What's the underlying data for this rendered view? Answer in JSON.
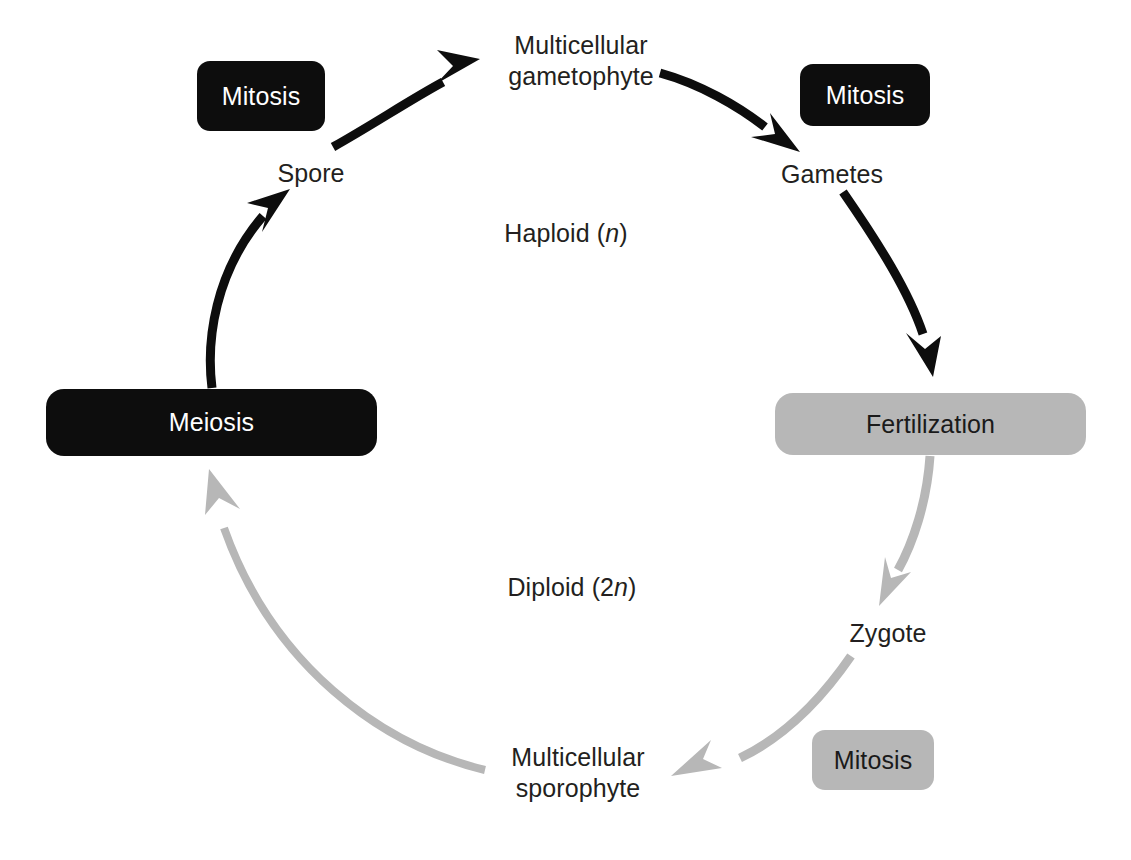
{
  "diagram": {
    "colors": {
      "haploid_phase": "#0d0d0d",
      "diploid_phase": "#b7b7b7",
      "background": "#ffffff",
      "text": "#231f20",
      "dark_box_text": "#ffffff",
      "light_box_text": "#1a1a1a"
    },
    "phase_labels": [
      {
        "id": "haploid",
        "prefix": "Haploid (",
        "variable": "n",
        "suffix": ")",
        "x": 566,
        "y": 232
      },
      {
        "id": "diploid",
        "prefix": "Diploid (2",
        "variable": "n",
        "suffix": ")",
        "x": 572,
        "y": 586
      }
    ],
    "nodes": [
      {
        "id": "spore",
        "label": "Spore",
        "x": 311,
        "y": 171,
        "lines": 1
      },
      {
        "id": "multicellular-gametophyte",
        "label": "Multicellular\ngametophyte",
        "x": 581,
        "y": 58,
        "lines": 2
      },
      {
        "id": "gametes",
        "label": "Gametes",
        "x": 832,
        "y": 172,
        "lines": 1
      },
      {
        "id": "zygote",
        "label": "Zygote",
        "x": 888,
        "y": 631,
        "lines": 1
      },
      {
        "id": "multicellular-sporophyte",
        "label": "Multicellular\nsporophyte",
        "x": 578,
        "y": 770,
        "lines": 2
      }
    ],
    "process_boxes": [
      {
        "id": "mitosis-spore",
        "label": "Mitosis",
        "phase": "dark",
        "x": 197,
        "y": 61,
        "w": 128,
        "h": 70,
        "wide": false
      },
      {
        "id": "mitosis-gametes",
        "label": "Mitosis",
        "phase": "dark",
        "x": 800,
        "y": 64,
        "w": 130,
        "h": 62,
        "wide": false
      },
      {
        "id": "meiosis",
        "label": "Meiosis",
        "phase": "dark",
        "x": 46,
        "y": 389,
        "w": 331,
        "h": 67,
        "wide": true
      },
      {
        "id": "fertilization",
        "label": "Fertilization",
        "phase": "light",
        "x": 775,
        "y": 393,
        "w": 311,
        "h": 62,
        "wide": true
      },
      {
        "id": "mitosis-sporophyte",
        "label": "Mitosis",
        "phase": "light",
        "x": 812,
        "y": 730,
        "w": 122,
        "h": 60,
        "wide": false
      }
    ],
    "arrows": [
      {
        "id": "meiosis-to-spore",
        "from": "meiosis",
        "to": "spore",
        "phase": "haploid"
      },
      {
        "id": "spore-to-gametophyte",
        "from": "spore",
        "to": "multicellular-gametophyte",
        "phase": "haploid"
      },
      {
        "id": "gametophyte-to-gametes",
        "from": "multicellular-gametophyte",
        "to": "gametes",
        "phase": "haploid"
      },
      {
        "id": "gametes-to-fertilization",
        "from": "gametes",
        "to": "fertilization",
        "phase": "haploid"
      },
      {
        "id": "fertilization-to-zygote",
        "from": "fertilization",
        "to": "zygote",
        "phase": "diploid"
      },
      {
        "id": "zygote-to-sporophyte",
        "from": "zygote",
        "to": "multicellular-sporophyte",
        "phase": "diploid"
      },
      {
        "id": "sporophyte-to-meiosis",
        "from": "multicellular-sporophyte",
        "to": "meiosis",
        "phase": "diploid"
      }
    ]
  }
}
